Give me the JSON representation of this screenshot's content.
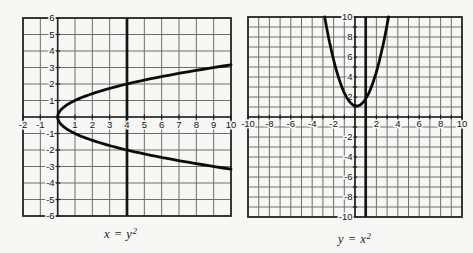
{
  "page": {
    "background": "#f7f7f5"
  },
  "colors": {
    "grid": "#6e6e6e",
    "axis": "#1f1f1f",
    "border": "#2a2a2a",
    "curve": "#0c0c0c",
    "emphasis_line": "#141414",
    "label": "#141414",
    "label_halo": "#f7f7f5"
  },
  "chart_data": [
    {
      "type": "line",
      "equation": "x = y^2",
      "caption": {
        "base": "x = y",
        "exponent": "2"
      },
      "x_range": [
        -2,
        10
      ],
      "y_range": [
        -6,
        6
      ],
      "grid_step": 1,
      "grid_on": true,
      "x_tick_labels": [
        -2,
        -1,
        1,
        2,
        3,
        4,
        5,
        6,
        7,
        8,
        9,
        10
      ],
      "y_tick_labels": [
        6,
        5,
        4,
        3,
        2,
        1,
        -1,
        -2,
        -3,
        -4,
        -5,
        -6
      ],
      "emphasized_vertical_line_x": 4,
      "curve": {
        "kind": "parabola",
        "orientation": "right",
        "vertex": [
          0,
          0
        ],
        "coefficient": 1
      },
      "key_points": [
        [
          0,
          0
        ],
        [
          1,
          1
        ],
        [
          1,
          -1
        ],
        [
          4,
          2
        ],
        [
          4,
          -2
        ],
        [
          9,
          3
        ],
        [
          9,
          -3
        ],
        [
          10,
          3.16
        ],
        [
          10,
          -3.16
        ]
      ]
    },
    {
      "type": "line",
      "equation": "y = x^2",
      "caption": {
        "base": "y = x",
        "exponent": "2"
      },
      "x_range": [
        -10,
        10
      ],
      "y_range": [
        -10,
        10
      ],
      "grid_step": 1,
      "grid_on": true,
      "x_tick_labels": [
        -10,
        -8,
        -6,
        -4,
        -2,
        2,
        4,
        6,
        8,
        10
      ],
      "y_tick_labels": [
        10,
        8,
        6,
        4,
        2,
        -2,
        -4,
        -6,
        -8,
        -10
      ],
      "emphasized_vertical_line_x": 1,
      "curve": {
        "kind": "parabola",
        "orientation": "up",
        "vertex": [
          0.15,
          1.1
        ],
        "coefficient": 1
      },
      "key_points": [
        [
          -3,
          9
        ],
        [
          -2,
          4
        ],
        [
          -1,
          1
        ],
        [
          0,
          0
        ],
        [
          1,
          1
        ],
        [
          2,
          4
        ],
        [
          3,
          9
        ]
      ]
    }
  ]
}
